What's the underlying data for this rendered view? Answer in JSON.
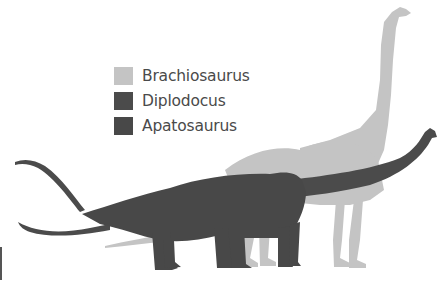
{
  "legend": {
    "items": [
      {
        "label": "Brachiosaurus",
        "color": "#c4c4c4"
      },
      {
        "label": "Diplodocus",
        "color": "#4b4b4b"
      },
      {
        "label": "Apatosaurus",
        "color": "#484848"
      }
    ]
  },
  "figures": [
    {
      "name": "Brachiosaurus",
      "color": "#c4c4c4",
      "description": "tall sauropod silhouette with upright neck, rear layer"
    },
    {
      "name": "Diplodocus",
      "color": "#4b4b4b",
      "description": "long horizontal sauropod with whip tail and long neck"
    },
    {
      "name": "Apatosaurus",
      "color": "#484848",
      "description": "bulky sauropod silhouette, front layer"
    }
  ]
}
